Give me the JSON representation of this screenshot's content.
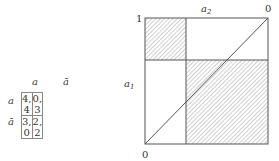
{
  "payoff_matrix": {
    "column_headers": [
      "a",
      "ā"
    ],
    "row_headers": [
      "a",
      "ā"
    ],
    "cells": [
      [
        "4, 4",
        "0, 3"
      ],
      [
        "3, 0",
        "2, 2"
      ]
    ]
  },
  "region_diagram": {
    "top_axis_label": "a",
    "top_axis_subscript": "2",
    "left_axis_label": "a",
    "left_axis_subscript": "1",
    "corner_top_left": "1",
    "corner_top_right": "0",
    "corner_bottom_left": "0",
    "hatched_regions": [
      "top-left",
      "bottom-right"
    ],
    "diagonal": "bottom-left to top-right"
  }
}
